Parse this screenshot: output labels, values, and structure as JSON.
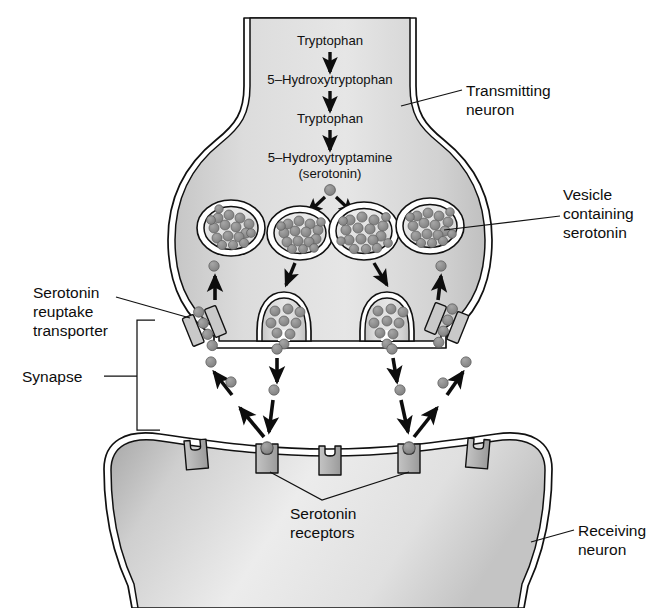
{
  "figure": {
    "background": "#ffffff"
  },
  "synthesis_pathway": {
    "steps": [
      "Tryptophan",
      "5–Hydroxytryptophan",
      "Tryptophan",
      "5–Hydroxytryptamine",
      "(serotonin)"
    ],
    "arrow_count": 3
  },
  "labels": {
    "transmitting_neuron": [
      "Transmitting",
      "neuron"
    ],
    "vesicle": [
      "Vesicle",
      "containing",
      "serotonin"
    ],
    "transporter": [
      "Serotonin",
      "reuptake",
      "transporter"
    ],
    "synapse": [
      "Synapse"
    ],
    "receptors": [
      "Serotonin",
      "receptors"
    ],
    "receiving_neuron": [
      "Receiving",
      "neuron"
    ]
  },
  "colors": {
    "cytoplasm_light": "#e3e3e3",
    "cytoplasm_dark": "#bdbdbd",
    "membrane_stroke": "#111111",
    "serotonin_dot": "#8a8a8a",
    "serotonin_dot_stroke": "#4a4a4a",
    "receptor_fill": "#b4b4b4",
    "transporter_fill": "#c9c9c9",
    "text": "#0d0d0d"
  },
  "counts": {
    "vesicles": 4,
    "fusion_pockets": 2,
    "receptors": 5,
    "receptors_bound": 2,
    "reuptake_transporters": 2
  },
  "elements": {
    "vesicles": [
      {
        "cx": 231,
        "cy": 228,
        "rx": 33,
        "ry": 27,
        "granules": 17
      },
      {
        "cx": 300,
        "cy": 233,
        "rx": 32,
        "ry": 26,
        "granules": 16
      },
      {
        "cx": 364,
        "cy": 231,
        "rx": 34,
        "ry": 28,
        "granules": 18
      },
      {
        "cx": 430,
        "cy": 226,
        "rx": 33,
        "ry": 27,
        "granules": 17
      }
    ],
    "fusion_pockets": [
      {
        "x": 281,
        "y": 318,
        "granules": 9
      },
      {
        "x": 384,
        "y": 318,
        "granules": 9
      }
    ],
    "receptors": [
      {
        "x": 196,
        "bound": false
      },
      {
        "x": 267,
        "bound": true
      },
      {
        "x": 330,
        "bound": false
      },
      {
        "x": 409,
        "bound": true
      },
      {
        "x": 478,
        "bound": false
      }
    ],
    "transporters": [
      {
        "x": 204,
        "y": 325,
        "angle": -22
      },
      {
        "x": 447,
        "y": 322,
        "angle": 22
      }
    ]
  }
}
